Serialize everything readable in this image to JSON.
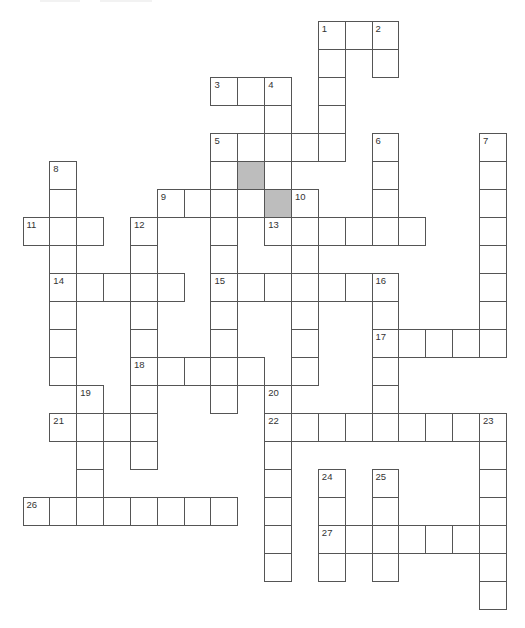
{
  "puzzle": {
    "type": "crossword",
    "grid_geometry": {
      "origin_x": 22.5,
      "origin_y": 21,
      "cell_w": 26.85,
      "cell_h": 28
    },
    "colors": {
      "border": "#555555",
      "cell": "#ffffff",
      "shaded": "#bdbdbd",
      "number": "#333333"
    },
    "shaded_cells": [
      [
        5,
        8
      ],
      [
        6,
        9
      ]
    ],
    "words": [
      {
        "num": "1",
        "dir": "across",
        "row": 0,
        "col": 11,
        "len": 3
      },
      {
        "num": "1",
        "dir": "down",
        "row": 0,
        "col": 11,
        "len": 5
      },
      {
        "num": "2",
        "dir": "down",
        "row": 0,
        "col": 13,
        "len": 2
      },
      {
        "num": "3",
        "dir": "across",
        "row": 2,
        "col": 7,
        "len": 3
      },
      {
        "num": "4",
        "dir": "down",
        "row": 2,
        "col": 9,
        "len": 4
      },
      {
        "num": "5",
        "dir": "across",
        "row": 4,
        "col": 7,
        "len": 5
      },
      {
        "num": "5",
        "dir": "down",
        "row": 4,
        "col": 7,
        "len": 10
      },
      {
        "num": "6",
        "dir": "down",
        "row": 4,
        "col": 13,
        "len": 4
      },
      {
        "num": "7",
        "dir": "down",
        "row": 4,
        "col": 17,
        "len": 8
      },
      {
        "num": "8",
        "dir": "down",
        "row": 5,
        "col": 1,
        "len": 8
      },
      {
        "num": "9",
        "dir": "across",
        "row": 6,
        "col": 5,
        "len": 4
      },
      {
        "num": "10",
        "dir": "down",
        "row": 6,
        "col": 10,
        "len": 7
      },
      {
        "num": "11",
        "dir": "across",
        "row": 7,
        "col": 0,
        "len": 3
      },
      {
        "num": "12",
        "dir": "down",
        "row": 7,
        "col": 4,
        "len": 9
      },
      {
        "num": "13",
        "dir": "across",
        "row": 7,
        "col": 9,
        "len": 6
      },
      {
        "num": "14",
        "dir": "across",
        "row": 9,
        "col": 1,
        "len": 5
      },
      {
        "num": "15",
        "dir": "across",
        "row": 9,
        "col": 7,
        "len": 7
      },
      {
        "num": "16",
        "dir": "down",
        "row": 9,
        "col": 13,
        "len": 6
      },
      {
        "num": "17",
        "dir": "across",
        "row": 11,
        "col": 13,
        "len": 5
      },
      {
        "num": "18",
        "dir": "across",
        "row": 12,
        "col": 4,
        "len": 5
      },
      {
        "num": "19",
        "dir": "down",
        "row": 13,
        "col": 2,
        "len": 5
      },
      {
        "num": "20",
        "dir": "down",
        "row": 13,
        "col": 9,
        "len": 7
      },
      {
        "num": "21",
        "dir": "across",
        "row": 14,
        "col": 1,
        "len": 4
      },
      {
        "num": "22",
        "dir": "across",
        "row": 14,
        "col": 9,
        "len": 9
      },
      {
        "num": "23",
        "dir": "down",
        "row": 14,
        "col": 17,
        "len": 7
      },
      {
        "num": "24",
        "dir": "down",
        "row": 16,
        "col": 11,
        "len": 4
      },
      {
        "num": "25",
        "dir": "down",
        "row": 16,
        "col": 13,
        "len": 4
      },
      {
        "num": "26",
        "dir": "across",
        "row": 17,
        "col": 0,
        "len": 8
      },
      {
        "num": "27",
        "dir": "across",
        "row": 18,
        "col": 11,
        "len": 7
      }
    ]
  }
}
